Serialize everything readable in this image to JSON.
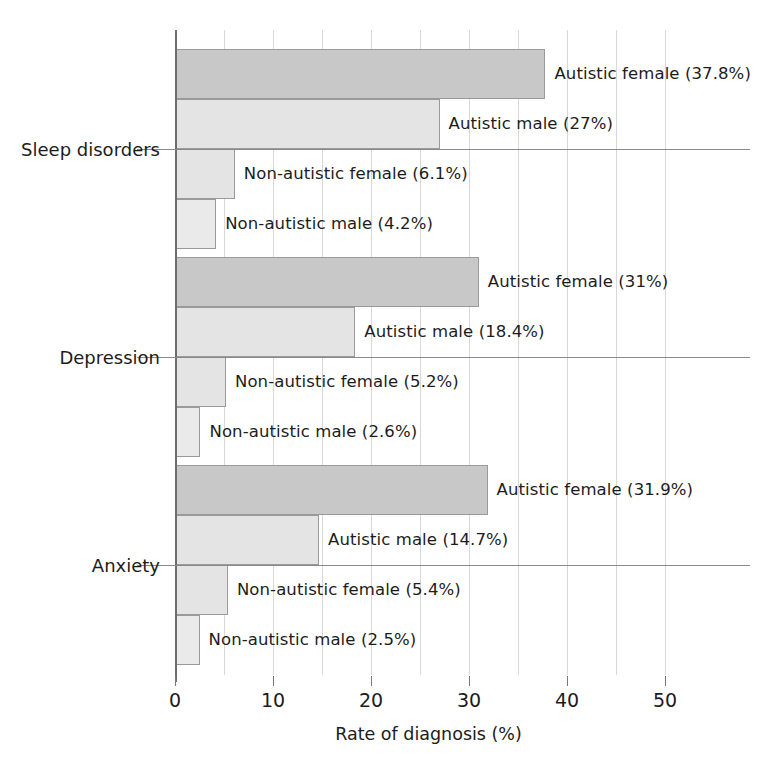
{
  "chart_data": {
    "type": "bar",
    "orientation": "horizontal",
    "title": "",
    "xlabel": "Rate of diagnosis (%)",
    "ylabel": "",
    "xlim": [
      0,
      56
    ],
    "xticks": [
      0,
      10,
      20,
      30,
      40,
      50
    ],
    "xtick_labels": [
      "0",
      "10",
      "20",
      "30",
      "40",
      "50"
    ],
    "gridlines_every": 5,
    "grid": true,
    "legend": "none (series named in bar labels)",
    "categories": [
      "Sleep disorders",
      "Depression",
      "Anxiety"
    ],
    "series": [
      {
        "name": "Autistic female",
        "color": "#c8c8c8",
        "values": [
          37.8,
          31,
          31.9
        ]
      },
      {
        "name": "Autistic male",
        "color": "#e4e4e4",
        "values": [
          27,
          18.4,
          14.7
        ]
      },
      {
        "name": "Non-autistic female",
        "color": "#e4e4e4",
        "values": [
          6.1,
          5.2,
          5.4
        ]
      },
      {
        "name": "Non-autistic male",
        "color": "#eaeaea",
        "values": [
          4.2,
          2.6,
          2.5
        ]
      }
    ],
    "bar_labels": [
      [
        "Autistic female (37.8%)",
        "Autistic male (27%)",
        "Non-autistic female (6.1%)",
        "Non-autistic male (4.2%)"
      ],
      [
        "Autistic female (31%)",
        "Autistic male (18.4%)",
        "Non-autistic female (5.2%)",
        "Non-autistic male (2.6%)"
      ],
      [
        "Autistic female (31.9%)",
        "Autistic male (14.7%)",
        "Non-autistic female (5.4%)",
        "Non-autistic male (2.5%)"
      ]
    ]
  },
  "axis": {
    "x_title": "Rate of diagnosis (%)",
    "ticks": [
      {
        "label": "0",
        "value": 0
      },
      {
        "label": "10",
        "value": 10
      },
      {
        "label": "20",
        "value": 20
      },
      {
        "label": "30",
        "value": 30
      },
      {
        "label": "40",
        "value": 40
      },
      {
        "label": "50",
        "value": 50
      }
    ]
  },
  "categories": [
    {
      "label": "Sleep disorders"
    },
    {
      "label": "Depression"
    },
    {
      "label": "Anxiety"
    }
  ],
  "bars": [
    {
      "group": "Sleep disorders",
      "series": "Autistic female",
      "value": 37.8,
      "label": "Autistic female (37.8%)"
    },
    {
      "group": "Sleep disorders",
      "series": "Autistic male",
      "value": 27,
      "label": "Autistic male (27%)"
    },
    {
      "group": "Sleep disorders",
      "series": "Non-autistic female",
      "value": 6.1,
      "label": "Non-autistic female (6.1%)"
    },
    {
      "group": "Sleep disorders",
      "series": "Non-autistic male",
      "value": 4.2,
      "label": "Non-autistic male (4.2%)"
    },
    {
      "group": "Depression",
      "series": "Autistic female",
      "value": 31,
      "label": "Autistic female (31%)"
    },
    {
      "group": "Depression",
      "series": "Autistic male",
      "value": 18.4,
      "label": "Autistic male (18.4%)"
    },
    {
      "group": "Depression",
      "series": "Non-autistic female",
      "value": 5.2,
      "label": "Non-autistic female (5.2%)"
    },
    {
      "group": "Depression",
      "series": "Non-autistic male",
      "value": 2.6,
      "label": "Non-autistic male (2.6%)"
    },
    {
      "group": "Anxiety",
      "series": "Autistic female",
      "value": 31.9,
      "label": "Autistic female (31.9%)"
    },
    {
      "group": "Anxiety",
      "series": "Autistic male",
      "value": 14.7,
      "label": "Autistic male (14.7%)"
    },
    {
      "group": "Anxiety",
      "series": "Non-autistic female",
      "value": 5.4,
      "label": "Non-autistic female (5.4%)"
    },
    {
      "group": "Anxiety",
      "series": "Non-autistic male",
      "value": 2.5,
      "label": "Non-autistic male (2.5%)"
    }
  ],
  "colors": {
    "autistic_female": "#c8c8c8",
    "autistic_male": "#e4e4e4",
    "non_autistic_female": "#e4e4e4",
    "non_autistic_male": "#eaeaea",
    "grid": "#d8d8d8",
    "axis": "#6d6d6d",
    "text": "#1c1c1c",
    "background": "#ffffff"
  }
}
